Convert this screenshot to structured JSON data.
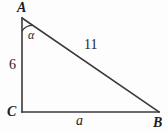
{
  "figure": {
    "type": "right-triangle-diagram",
    "background_color": "#fdfdfd",
    "stroke_color": "#3a3a3a",
    "text_color": "#1d1d1d",
    "vertices": [
      {
        "name": "A",
        "label": "A",
        "x": 22,
        "y": 18
      },
      {
        "name": "B",
        "label": "B",
        "x": 159,
        "y": 112
      },
      {
        "name": "C",
        "label": "C",
        "x": 22,
        "y": 112
      }
    ],
    "sides": [
      {
        "name": "leg-AC",
        "label": "6",
        "from": "A",
        "to": "C",
        "style": "upright"
      },
      {
        "name": "hypotenuse-AB",
        "label": "11",
        "from": "A",
        "to": "B",
        "style": "upright"
      },
      {
        "name": "leg-CB",
        "label": "a",
        "from": "C",
        "to": "B",
        "style": "italic"
      }
    ],
    "angles": [
      {
        "name": "angle-at-A",
        "label": "α",
        "at_vertex": "A",
        "arc_radius": 13
      }
    ]
  }
}
